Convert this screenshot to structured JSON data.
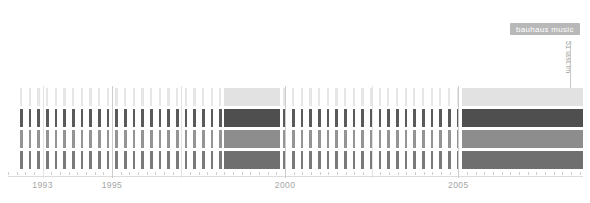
{
  "badge": {
    "label": "bauhaus music",
    "color": "#b8b8b8",
    "text_color": "#ffffff"
  },
  "source_label": {
    "text": "51 last.fm",
    "color": "#9a9a9a"
  },
  "chart_data": {
    "type": "heatmap",
    "title": "bauhaus music",
    "xlabel": "",
    "ylabel": "",
    "xlim": [
      1992.0,
      2008.6
    ],
    "grid": false,
    "legend_position": "none",
    "axis": {
      "tick_labels": [
        "1993",
        "1995",
        "2000",
        "2005"
      ],
      "tick_values": [
        1993,
        1995,
        2000,
        2005
      ],
      "minor_tick_step": 0.25
    },
    "rows": [
      {
        "name": "row-1",
        "color": "#e2e2e2",
        "bar_color": "#e6e6e6"
      },
      {
        "name": "row-2",
        "color": "#4f4f4f",
        "bar_color": "#5a5a5a"
      },
      {
        "name": "row-3",
        "color": "#8d8d8d",
        "bar_color": "#949494"
      },
      {
        "name": "row-4",
        "color": "#6f6f6f",
        "bar_color": "#7a7a7a"
      }
    ],
    "ticks_x": [
      1992.35,
      1992.6,
      1992.85,
      1993.1,
      1993.35,
      1993.6,
      1993.85,
      1994.1,
      1994.35,
      1994.6,
      1994.85,
      1995.1,
      1995.35,
      1995.6,
      1995.85,
      1996.1,
      1996.35,
      1996.6,
      1996.85,
      1997.1,
      1997.35,
      1997.6,
      1997.85,
      1998.1,
      1999.95,
      2000.2,
      2000.45,
      2000.7,
      2000.95,
      2001.2,
      2001.45,
      2001.7,
      2001.95,
      2002.2,
      2002.45,
      2002.7,
      2002.95,
      2003.2,
      2003.45,
      2003.7,
      2003.95,
      2004.2,
      2004.45,
      2004.7,
      2004.95
    ],
    "blocks": [
      {
        "name": "block-1998",
        "x0": 1998.25,
        "x1": 1999.85
      },
      {
        "name": "block-2005",
        "x0": 2005.1,
        "x1": 2008.6
      }
    ],
    "guides": [
      {
        "x": 1993.0,
        "strong": false
      },
      {
        "x": 1995.0,
        "strong": true
      },
      {
        "x": 1997.0,
        "strong": false
      },
      {
        "x": 2000.0,
        "strong": true
      },
      {
        "x": 2002.5,
        "strong": false
      },
      {
        "x": 2005.0,
        "strong": true
      }
    ]
  }
}
